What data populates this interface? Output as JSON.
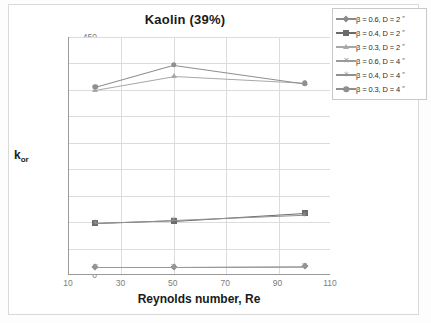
{
  "chart_data": {
    "type": "line",
    "title": "Kaolin (39%)",
    "xlabel": "Reynolds number, Re",
    "ylabel": "k",
    "ylabel_sub": "or",
    "xlim": [
      10,
      110
    ],
    "ylim": [
      0,
      450
    ],
    "xticks": [
      10,
      30,
      50,
      70,
      90,
      110
    ],
    "yticks": [
      0,
      50,
      100,
      150,
      200,
      250,
      300,
      350,
      400,
      450
    ],
    "grid": "both",
    "legend_position": "top-right-outside",
    "x": [
      20,
      50,
      100
    ],
    "series": [
      {
        "name": "β = 0.6, D = 2 ˮ",
        "marker": "diamond",
        "color": "#8a8a8a",
        "values": [
          16,
          16,
          17
        ]
      },
      {
        "name": "β = 0.4, D = 2 ˮ",
        "marker": "square",
        "color": "#6b6b6b",
        "values": [
          98,
          103,
          118
        ]
      },
      {
        "name": "β = 0.3, D = 2 ˮ",
        "marker": "triangle",
        "color": "#a8a8a8",
        "values": [
          350,
          376,
          363
        ]
      },
      {
        "name": "β = 0.6, D = 4 ˮ",
        "marker": "x",
        "color": "#9a9a9a",
        "values": [
          16,
          16,
          17
        ]
      },
      {
        "name": "β = 0.4, D = 4 ˮ",
        "marker": "star",
        "color": "#909090",
        "values": [
          99,
          104,
          114
        ]
      },
      {
        "name": "β = 0.3, D = 4 ˮ",
        "marker": "circle",
        "color": "#8f8f8f",
        "values": [
          356,
          398,
          363
        ]
      }
    ]
  }
}
